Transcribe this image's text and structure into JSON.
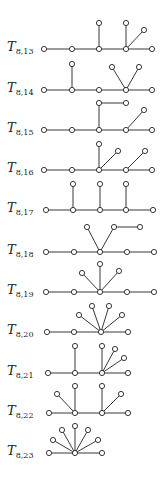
{
  "diagram": {
    "title": "",
    "style": {
      "edge_color": "#222222",
      "node_fill": "#ffffff",
      "node_stroke": "#222222",
      "node_radius": 2.6
    },
    "trees": [
      {
        "label": "T",
        "subscript": "8,13",
        "label_x": 7,
        "label_y": 49,
        "nodes": [
          [
            44,
            49
          ],
          [
            72,
            49
          ],
          [
            99,
            49
          ],
          [
            126,
            49
          ],
          [
            152,
            49
          ],
          [
            99,
            23
          ],
          [
            126,
            23
          ],
          [
            144,
            30
          ]
        ],
        "edges": [
          [
            0,
            1
          ],
          [
            1,
            2
          ],
          [
            2,
            3
          ],
          [
            3,
            4
          ],
          [
            2,
            5
          ],
          [
            3,
            6
          ],
          [
            3,
            7
          ]
        ]
      },
      {
        "label": "T",
        "subscript": "8,14",
        "label_x": 7,
        "label_y": 90,
        "nodes": [
          [
            44,
            90
          ],
          [
            72,
            90
          ],
          [
            99,
            90
          ],
          [
            126,
            90
          ],
          [
            152,
            90
          ],
          [
            72,
            64
          ],
          [
            112,
            67
          ],
          [
            139,
            67
          ]
        ],
        "edges": [
          [
            0,
            1
          ],
          [
            1,
            2
          ],
          [
            2,
            3
          ],
          [
            3,
            4
          ],
          [
            1,
            5
          ],
          [
            3,
            6
          ],
          [
            3,
            7
          ]
        ]
      },
      {
        "label": "T",
        "subscript": "8,15",
        "label_x": 7,
        "label_y": 130,
        "nodes": [
          [
            44,
            130
          ],
          [
            72,
            130
          ],
          [
            99,
            130
          ],
          [
            126,
            130
          ],
          [
            152,
            130
          ],
          [
            99,
            103
          ],
          [
            126,
            103
          ],
          [
            144,
            110
          ]
        ],
        "edges": [
          [
            0,
            1
          ],
          [
            1,
            2
          ],
          [
            2,
            3
          ],
          [
            3,
            4
          ],
          [
            2,
            5
          ],
          [
            5,
            6
          ],
          [
            3,
            7
          ]
        ]
      },
      {
        "label": "T",
        "subscript": "8,16",
        "label_x": 7,
        "label_y": 170,
        "nodes": [
          [
            44,
            170
          ],
          [
            72,
            170
          ],
          [
            99,
            170
          ],
          [
            126,
            170
          ],
          [
            152,
            170
          ],
          [
            99,
            144
          ],
          [
            118,
            151
          ],
          [
            145,
            151
          ]
        ],
        "edges": [
          [
            0,
            1
          ],
          [
            1,
            2
          ],
          [
            2,
            3
          ],
          [
            3,
            4
          ],
          [
            2,
            5
          ],
          [
            2,
            6
          ],
          [
            3,
            7
          ]
        ]
      },
      {
        "label": "T",
        "subscript": "8,17",
        "label_x": 7,
        "label_y": 210,
        "nodes": [
          [
            46,
            210
          ],
          [
            73,
            210
          ],
          [
            100,
            210
          ],
          [
            126,
            210
          ],
          [
            153,
            210
          ],
          [
            73,
            184
          ],
          [
            100,
            184
          ],
          [
            126,
            184
          ]
        ],
        "edges": [
          [
            0,
            1
          ],
          [
            1,
            2
          ],
          [
            2,
            3
          ],
          [
            3,
            4
          ],
          [
            1,
            5
          ],
          [
            2,
            6
          ],
          [
            3,
            7
          ]
        ]
      },
      {
        "label": "T",
        "subscript": "8,18",
        "label_x": 7,
        "label_y": 252,
        "nodes": [
          [
            46,
            252
          ],
          [
            74,
            252
          ],
          [
            100,
            252
          ],
          [
            127,
            252
          ],
          [
            154,
            252
          ],
          [
            87,
            227
          ],
          [
            114,
            227
          ],
          [
            140,
            227
          ]
        ],
        "edges": [
          [
            0,
            1
          ],
          [
            1,
            2
          ],
          [
            2,
            3
          ],
          [
            3,
            4
          ],
          [
            2,
            5
          ],
          [
            2,
            6
          ],
          [
            6,
            7
          ]
        ]
      },
      {
        "label": "T",
        "subscript": "8,19",
        "label_x": 7,
        "label_y": 292,
        "nodes": [
          [
            46,
            292
          ],
          [
            74,
            292
          ],
          [
            100,
            292
          ],
          [
            127,
            292
          ],
          [
            154,
            292
          ],
          [
            82,
            273
          ],
          [
            100,
            264
          ],
          [
            119,
            271
          ]
        ],
        "edges": [
          [
            0,
            1
          ],
          [
            1,
            2
          ],
          [
            2,
            3
          ],
          [
            3,
            4
          ],
          [
            2,
            5
          ],
          [
            2,
            6
          ],
          [
            2,
            7
          ]
        ]
      },
      {
        "label": "T",
        "subscript": "8,20",
        "label_x": 7,
        "label_y": 332,
        "nodes": [
          [
            47,
            332
          ],
          [
            74,
            332
          ],
          [
            101,
            332
          ],
          [
            128,
            332
          ],
          [
            79,
            315
          ],
          [
            92,
            306
          ],
          [
            109,
            306
          ],
          [
            122,
            315
          ]
        ],
        "edges": [
          [
            0,
            1
          ],
          [
            1,
            2
          ],
          [
            2,
            3
          ],
          [
            2,
            4
          ],
          [
            2,
            5
          ],
          [
            2,
            6
          ],
          [
            2,
            7
          ]
        ]
      },
      {
        "label": "T",
        "subscript": "8,21",
        "label_x": 7,
        "label_y": 373,
        "nodes": [
          [
            48,
            373
          ],
          [
            75,
            373
          ],
          [
            102,
            373
          ],
          [
            128,
            373
          ],
          [
            75,
            346
          ],
          [
            102,
            346
          ],
          [
            115,
            349
          ],
          [
            124,
            358
          ]
        ],
        "edges": [
          [
            0,
            1
          ],
          [
            1,
            2
          ],
          [
            2,
            3
          ],
          [
            1,
            4
          ],
          [
            2,
            5
          ],
          [
            2,
            6
          ],
          [
            2,
            7
          ]
        ]
      },
      {
        "label": "T",
        "subscript": "8,22",
        "label_x": 7,
        "label_y": 413,
        "nodes": [
          [
            49,
            413
          ],
          [
            75,
            413
          ],
          [
            102,
            413
          ],
          [
            128,
            413
          ],
          [
            57,
            394
          ],
          [
            75,
            386
          ],
          [
            102,
            386
          ],
          [
            121,
            394
          ]
        ],
        "edges": [
          [
            0,
            1
          ],
          [
            1,
            2
          ],
          [
            2,
            3
          ],
          [
            1,
            4
          ],
          [
            1,
            5
          ],
          [
            2,
            6
          ],
          [
            2,
            7
          ]
        ]
      },
      {
        "label": "T",
        "subscript": "8,23",
        "label_x": 7,
        "label_y": 453,
        "nodes": [
          [
            49,
            453
          ],
          [
            75,
            453
          ],
          [
            102,
            453
          ],
          [
            53,
            440
          ],
          [
            62,
            430
          ],
          [
            75,
            426
          ],
          [
            88,
            430
          ],
          [
            98,
            440
          ]
        ],
        "edges": [
          [
            0,
            1
          ],
          [
            1,
            2
          ],
          [
            1,
            3
          ],
          [
            1,
            4
          ],
          [
            1,
            5
          ],
          [
            1,
            6
          ],
          [
            1,
            7
          ]
        ]
      }
    ]
  }
}
